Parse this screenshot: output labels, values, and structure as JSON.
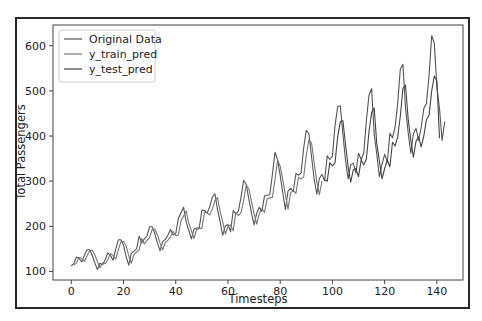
{
  "chart_data": {
    "type": "line",
    "title": "",
    "xlabel": "Timesteps",
    "ylabel": "Total Passengers",
    "xlim": [
      -7,
      150
    ],
    "ylim": [
      81,
      646
    ],
    "xticks": [
      0,
      20,
      40,
      60,
      80,
      100,
      120,
      140
    ],
    "yticks": [
      100,
      200,
      300,
      400,
      500,
      600
    ],
    "grid": false,
    "legend_position": "upper left",
    "legend": [
      "Original Data",
      "y_train_pred",
      "y_test_pred"
    ],
    "series": [
      {
        "name": "Original Data",
        "color": "#555555",
        "x_start": 0,
        "values": [
          112,
          118,
          132,
          129,
          121,
          135,
          148,
          148,
          136,
          119,
          104,
          118,
          115,
          126,
          141,
          135,
          125,
          149,
          170,
          170,
          158,
          133,
          114,
          140,
          145,
          150,
          178,
          163,
          172,
          178,
          199,
          199,
          184,
          162,
          146,
          166,
          171,
          180,
          193,
          181,
          183,
          218,
          230,
          242,
          209,
          191,
          172,
          194,
          196,
          196,
          236,
          235,
          229,
          243,
          264,
          272,
          237,
          211,
          180,
          201,
          204,
          188,
          235,
          227,
          234,
          264,
          302,
          293,
          259,
          229,
          203,
          229,
          242,
          233,
          267,
          269,
          270,
          315,
          364,
          347,
          312,
          274,
          237,
          278,
          284,
          277,
          317,
          313,
          318,
          374,
          413,
          405,
          355,
          306,
          271,
          306,
          315,
          301,
          356,
          348,
          355,
          422,
          465,
          467,
          404,
          347,
          305,
          336,
          340,
          318,
          362,
          348,
          363,
          435,
          491,
          505,
          404,
          359,
          310,
          337,
          360,
          342,
          406,
          396,
          420,
          472,
          548,
          559,
          463,
          407,
          362,
          405,
          417,
          391,
          419,
          461,
          472,
          535,
          622,
          606,
          508,
          461,
          390,
          432
        ]
      },
      {
        "name": "y_train_pred",
        "color": "#777777",
        "x_start": 1,
        "values": [
          114,
          119,
          131,
          129,
          122,
          134,
          146,
          147,
          137,
          122,
          108,
          119,
          117,
          126,
          140,
          135,
          127,
          147,
          166,
          167,
          157,
          135,
          118,
          138,
          143,
          148,
          173,
          161,
          169,
          175,
          193,
          194,
          181,
          162,
          148,
          164,
          169,
          177,
          189,
          179,
          181,
          212,
          223,
          234,
          206,
          190,
          173,
          193,
          195,
          196,
          231,
          230,
          225,
          238,
          257,
          264,
          233,
          210,
          183,
          200,
          203,
          190,
          231,
          224,
          230,
          257,
          291,
          283,
          254,
          228,
          205,
          228,
          239,
          231,
          261,
          263,
          264,
          304,
          347,
          333,
          303,
          270,
          238,
          274,
          279,
          273,
          308,
          305,
          309,
          358,
          392,
          385,
          342,
          299,
          270,
          300
        ]
      },
      {
        "name": "y_test_pred",
        "color": "#444444",
        "x_start": 97,
        "values": [
          303,
          300,
          341,
          334,
          340,
          397,
          432,
          434,
          382,
          333,
          298,
          325,
          328,
          310,
          347,
          336,
          349,
          410,
          452,
          462,
          382,
          345,
          305,
          328,
          347,
          332,
          386,
          378,
          398,
          444,
          505,
          513,
          437,
          391,
          353,
          388,
          398,
          376,
          400,
          436,
          446,
          500,
          533,
          522,
          395
        ]
      }
    ]
  },
  "axes": {
    "x_tick_labels": [
      "0",
      "20",
      "40",
      "60",
      "80",
      "100",
      "120",
      "140"
    ],
    "y_tick_labels": [
      "100",
      "200",
      "300",
      "400",
      "500",
      "600"
    ],
    "xlabel": "Timesteps",
    "ylabel": "Total Passengers"
  },
  "legend": {
    "items": [
      {
        "label": "Original Data",
        "color": "#555555"
      },
      {
        "label": "y_train_pred",
        "color": "#777777"
      },
      {
        "label": "y_test_pred",
        "color": "#444444"
      }
    ]
  }
}
